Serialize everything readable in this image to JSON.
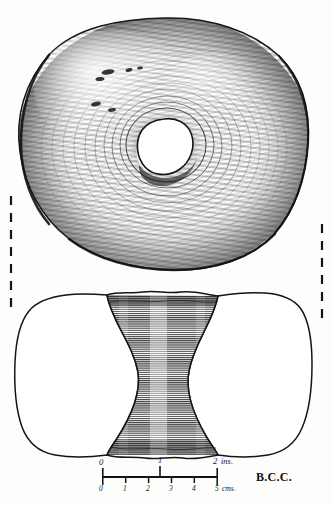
{
  "figure": {
    "technique": "pen-and-ink stipple and hatch line drawing",
    "background_color": "#fdfdfb",
    "ink_color": "#1a1a1a"
  },
  "views": {
    "plan": {
      "name": "plan-view",
      "description": "Top-down view of sub-circular perforated stone with central hole",
      "center_hole": {
        "cx": 164,
        "cy": 146,
        "r": 28
      }
    },
    "section": {
      "name": "cross-section-view",
      "description": "Longitudinal cross-section showing hourglass biconical perforation",
      "hatch": "dense horizontal line hatching"
    }
  },
  "section_markers": {
    "left_dashed_line": {
      "x": 11,
      "y_top": 196,
      "y_bottom": 307
    },
    "right_dashed_line": {
      "x": 322,
      "y_top": 224,
      "y_bottom": 320
    }
  },
  "scale_bar": {
    "name": "scale-bar",
    "x_start": 102,
    "x_end": 218,
    "y_axis": 477,
    "inches": {
      "unit_label": "ins.",
      "ticks": [
        "0",
        "1",
        "2"
      ],
      "tick_values": [
        0,
        1,
        2
      ],
      "max": 2
    },
    "centimetres": {
      "unit_label": "cms.",
      "ticks": [
        "0",
        "1",
        "2",
        "3",
        "4",
        "5"
      ],
      "tick_values": [
        0,
        1,
        2,
        3,
        4,
        5
      ],
      "max": 5
    }
  },
  "signature": {
    "name": "artist-initials",
    "text": "B.C.C."
  }
}
